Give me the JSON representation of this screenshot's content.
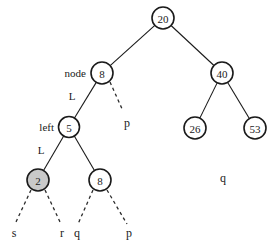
{
  "diagram": {
    "background_color": "#ffffff",
    "stroke_color": "#1a1a1a",
    "highlight_fill": "#c9c9c9",
    "node_fill": "#ffffff"
  },
  "nodes": [
    {
      "id": "root",
      "label": "20",
      "cx": 163,
      "cy": 18,
      "r": 11,
      "highlighted": false
    },
    {
      "id": "node8",
      "label": "8",
      "cx": 102,
      "cy": 73,
      "r": 11,
      "highlighted": false
    },
    {
      "id": "node40",
      "label": "40",
      "cx": 222,
      "cy": 73,
      "r": 11,
      "highlighted": false
    },
    {
      "id": "node5",
      "label": "5",
      "cx": 69,
      "cy": 127,
      "r": 10.5,
      "highlighted": false
    },
    {
      "id": "node26",
      "label": "26",
      "cx": 195,
      "cy": 128,
      "r": 11,
      "highlighted": false
    },
    {
      "id": "node53",
      "label": "53",
      "cx": 255,
      "cy": 128,
      "r": 11,
      "highlighted": false
    },
    {
      "id": "node2",
      "label": "2",
      "cx": 38,
      "cy": 180,
      "r": 11,
      "highlighted": true
    },
    {
      "id": "node8lower",
      "label": "8",
      "cx": 100,
      "cy": 180,
      "r": 11,
      "highlighted": false
    }
  ],
  "edges": [
    {
      "from": "root",
      "to": "node8",
      "style": "solid"
    },
    {
      "from": "root",
      "to": "node40",
      "style": "solid"
    },
    {
      "from": "node8",
      "to": "node5",
      "style": "solid"
    },
    {
      "from": "node40",
      "to": "node26",
      "style": "solid"
    },
    {
      "from": "node40",
      "to": "node53",
      "style": "solid"
    },
    {
      "from": "node5",
      "to": "node2",
      "style": "solid"
    },
    {
      "from": "node5",
      "to": "node8lower",
      "style": "solid"
    }
  ],
  "dashed_edges": [
    {
      "id": "node8-to-p",
      "x1": 110,
      "y1": 82,
      "x2": 123,
      "y2": 111
    },
    {
      "id": "node2-to-s",
      "x1": 31,
      "y1": 190,
      "x2": 15,
      "y2": 224
    },
    {
      "id": "node2-to-r",
      "x1": 45,
      "y1": 190,
      "x2": 61,
      "y2": 224
    },
    {
      "id": "node8lower-to-q",
      "x1": 93,
      "y1": 190,
      "x2": 78,
      "y2": 224
    },
    {
      "id": "node8lower-to-p",
      "x1": 107,
      "y1": 190,
      "x2": 127,
      "y2": 224
    }
  ],
  "annotations": [
    {
      "id": "label-node",
      "text": "node",
      "x": 86,
      "y": 73,
      "align": "end"
    },
    {
      "id": "label-left",
      "text": "left",
      "x": 54,
      "y": 127,
      "align": "end"
    },
    {
      "id": "label-L-top",
      "text": "L",
      "x": 72,
      "y": 96,
      "align": "center"
    },
    {
      "id": "label-L-low",
      "text": "L",
      "x": 41,
      "y": 150,
      "align": "center"
    }
  ],
  "leaf_labels": [
    {
      "id": "leaf-p-upper",
      "text": "p",
      "x": 127,
      "y": 127
    },
    {
      "id": "leaf-s",
      "text": "s",
      "x": 14,
      "y": 237
    },
    {
      "id": "leaf-r",
      "text": "r",
      "x": 62,
      "y": 237
    },
    {
      "id": "leaf-q",
      "text": "q",
      "x": 77,
      "y": 237
    },
    {
      "id": "leaf-p-lower",
      "text": "p",
      "x": 129,
      "y": 237
    },
    {
      "id": "leaf-q-free",
      "text": "q",
      "x": 223,
      "y": 182
    }
  ]
}
